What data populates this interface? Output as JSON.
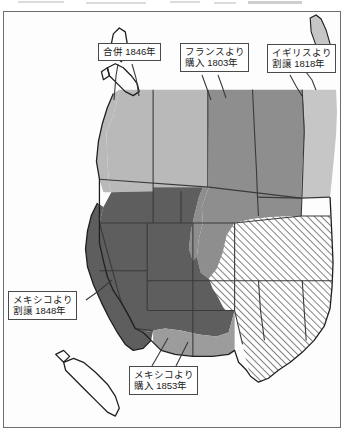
{
  "document": {
    "type": "historical-map",
    "subject": "アメリカ合衆国 領土拡張",
    "region": "アメリカ合衆国 西部"
  },
  "map": {
    "background_color": "#fdfdfd",
    "border_color": "#6e6e6e",
    "state_border_color": "#3a3a3a",
    "coastline_color": "#1f1f1f"
  },
  "territories": [
    {
      "id": "oregon-annexation",
      "label": "合併 1846年",
      "fill": "#b9b9b9",
      "pattern": "solid",
      "note": "オレゴン地方"
    },
    {
      "id": "louisiana-purchase",
      "label": "フランスより購入 1803年",
      "fill": "#8e8e8e",
      "pattern": "solid",
      "note": "ルイジアナ買収"
    },
    {
      "id": "red-river-cession",
      "label": "イギリスより割譲 1818年",
      "fill": "#c6c6c6",
      "pattern": "solid",
      "note": "レッドリバー"
    },
    {
      "id": "mexican-cession",
      "label": "メキシコより割譲 1848年",
      "fill": "#5e5e5e",
      "pattern": "solid",
      "note": "メキシコ割譲地"
    },
    {
      "id": "gadsden-purchase",
      "label": "メキシコより購入 1853年",
      "fill": "#9c9c9c",
      "pattern": "solid",
      "note": "ガズデン購入地"
    },
    {
      "id": "texas-annexation",
      "label": "テキサス併合",
      "fill": "#ffffff",
      "pattern": "diagonal-hatch",
      "note": "斜線部"
    }
  ],
  "callouts": [
    {
      "id": "callout-annex-1846",
      "lines": [
        "合併 1846年"
      ]
    },
    {
      "id": "callout-france-1803",
      "lines": [
        "フランスより",
        "購入 1803年"
      ]
    },
    {
      "id": "callout-britain-1818",
      "lines": [
        "イギリスより",
        "割譲 1818年"
      ]
    },
    {
      "id": "callout-mexico-cession",
      "lines": [
        "メキシコより",
        "割譲 1848年"
      ]
    },
    {
      "id": "callout-mexico-purchase",
      "lines": [
        "メキシコより",
        "購入 1853年"
      ]
    }
  ]
}
